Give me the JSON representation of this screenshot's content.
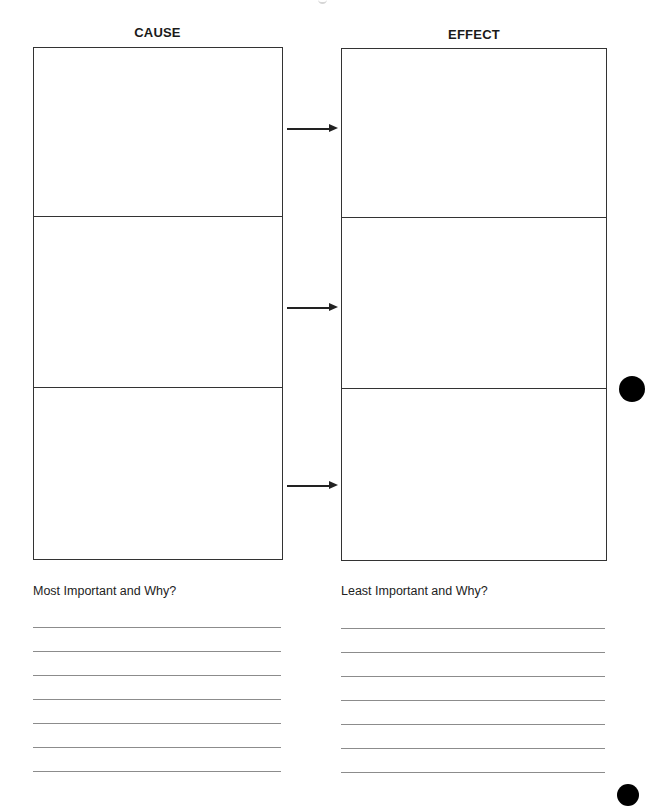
{
  "worksheet": {
    "columns": {
      "cause": {
        "heading": "CAUSE",
        "cells": [
          "",
          "",
          ""
        ]
      },
      "effect": {
        "heading": "EFFECT",
        "cells": [
          "",
          "",
          ""
        ]
      }
    },
    "arrows": [
      "cause-1-to-effect-1",
      "cause-2-to-effect-2",
      "cause-3-to-effect-3"
    ],
    "prompts": {
      "left": {
        "label": "Most Important and Why?",
        "lines": [
          "",
          "",
          "",
          "",
          "",
          "",
          ""
        ]
      },
      "right": {
        "label": "Least Important and Why?",
        "lines": [
          "",
          "",
          "",
          "",
          "",
          "",
          ""
        ]
      }
    }
  },
  "colors": {
    "ink": "#222222",
    "rule": "#8c8c8c",
    "paper": "#ffffff"
  }
}
